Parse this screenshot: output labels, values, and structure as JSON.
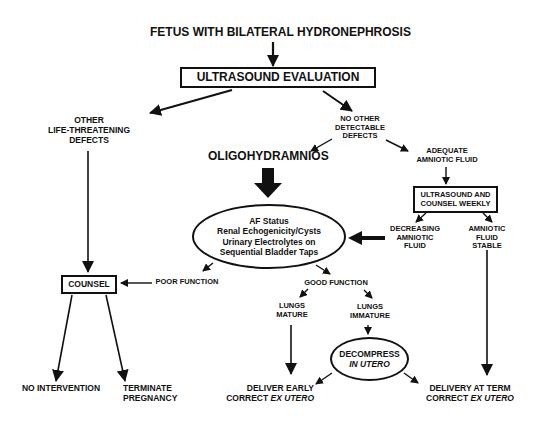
{
  "diagram": {
    "title": "FETUS WITH BILATERAL HYDRONEPHROSIS",
    "nodes": {
      "ultrasound_eval": "ULTRASOUND EVALUATION",
      "other_defects": [
        "OTHER",
        "LIFE-THREATENING",
        "DEFECTS"
      ],
      "no_other_defects": [
        "NO OTHER",
        "DETECTABLE",
        "DEFECTS"
      ],
      "oligohydramnios": "OLIGOHYDRAMNIOS",
      "adequate_fluid": [
        "ADEQUATE",
        "AMNIOTIC FLUID"
      ],
      "us_counsel_weekly": [
        "ULTRASOUND AND",
        "COUNSEL WEEKLY"
      ],
      "assessment": [
        "AF Status",
        "Renal Echogenicity/Cysts",
        "Urinary Electrolytes on",
        "Sequential Bladder Taps"
      ],
      "decreasing_fluid": [
        "DECREASING",
        "AMNIOTIC",
        "FLUID"
      ],
      "fluid_stable": [
        "AMNIOTIC",
        "FLUID",
        "STABLE"
      ],
      "counsel": "COUNSEL",
      "poor_function": "POOR FUNCTION",
      "good_function": "GOOD FUNCTION",
      "lungs_mature": [
        "LUNGS",
        "MATURE"
      ],
      "lungs_immature": [
        "LUNGS",
        "IMMATURE"
      ],
      "decompress": {
        "line1": "DECOMPRESS",
        "line2": "IN UTERO"
      },
      "no_intervention": "NO INTERVENTION",
      "terminate": [
        "TERMINATE",
        "PREGNANCY"
      ],
      "deliver_early": {
        "line1": "DELIVER EARLY",
        "line2_prefix": "CORRECT ",
        "line2_italic": "EX UTERO"
      },
      "delivery_term": {
        "line1": "DELIVERY AT TERM",
        "line2_prefix": "CORRECT ",
        "line2_italic": "EX UTERO"
      }
    },
    "colors": {
      "ink": "#111111",
      "background": "#ffffff"
    }
  }
}
